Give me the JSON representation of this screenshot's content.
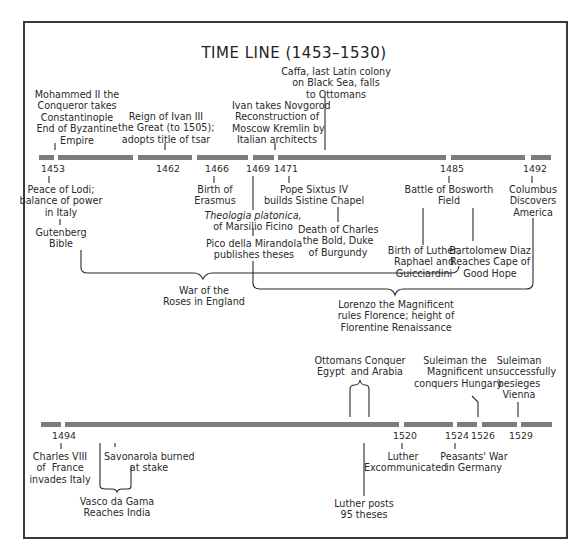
{
  "title": "TIME LINE (1453–1530)",
  "timeline_1": {
    "segments": [
      [
        39,
        54
      ],
      [
        58,
        133
      ],
      [
        138,
        192
      ],
      [
        197,
        248
      ],
      [
        253,
        274
      ],
      [
        278,
        446
      ],
      [
        451,
        525
      ],
      [
        531,
        551
      ]
    ],
    "years": [
      "1453",
      "1462",
      "1466",
      "1469",
      "1471",
      "1485",
      "1492"
    ],
    "above": {
      "mohammed": "Mohammed II the\nConqueror takes\nConstantinople\nEnd of Byzantine\nEmpire",
      "ivan_iii": "Reign of Ivan III\nthe Great (to 1505);\nadopts title of tsar",
      "caffa": "Caffa, last Latin colony\non Black Sea, falls\nto Ottomans",
      "novgorod": "Ivan takes Novgorod\nReconstruction of\nMoscow Kremlin by\nItalian architects"
    },
    "below": {
      "lodi": "Peace of Lodi;\nbalance of power\nin Italy",
      "gutenberg": "Gutenberg\nBible",
      "erasmus": "Birth of\nErasmus",
      "theologia_title": "Theologia platonica,",
      "theologia_author": "of Marsilio Ficino",
      "pico": "Pico della Mirandola\npublishes theses",
      "sixtus": "Pope Sixtus IV\nbuilds Sistine Chapel",
      "charles_bold": "Death of Charles\nthe Bold, Duke\nof Burgundy",
      "bosworth": "Battle of Bosworth\nField",
      "luther_birth": "Birth of Luther,\nRaphael and\nGuicciardini",
      "diaz": "Bartolomew Diaz\nReaches Cape of\nGood Hope",
      "columbus": "Columbus\nDiscovers\nAmerica",
      "war_roses": "War of the\nRoses in England",
      "lorenzo": "Lorenzo the Magnificent\nrules Florence; height of\nFlorentine Renaissance"
    }
  },
  "timeline_2": {
    "segments": [
      [
        41,
        61
      ],
      [
        65,
        399
      ],
      [
        404,
        453
      ],
      [
        457,
        477
      ],
      [
        482,
        517
      ],
      [
        521,
        552
      ]
    ],
    "years": [
      "1494",
      "1520",
      "1524",
      "1526",
      "1529"
    ],
    "above": {
      "ottomans": "Ottomans Conquer\nEgypt  and Arabia",
      "suleiman_hungary": "Suleiman the\nMagnificent\nconquers Hungary",
      "suleiman_vienna": "Suleiman\nunsuccessfully\nbesieges\nVienna"
    },
    "below": {
      "charles_viii": "Charles VIII\nof  France\ninvades Italy",
      "savonarola": "Savonarola burned\nat stake",
      "vasco": "Vasco da Gama\nReaches India",
      "luther_excomm": "Luther\nExcommunicated",
      "peasants": "Peasants' War\nin Germany",
      "luther_theses": "Luther posts\n95 theses"
    }
  },
  "colors": {
    "bar": "#7c7c7c",
    "ink": "#2a2a2a",
    "frame": "#3a3a3a"
  }
}
